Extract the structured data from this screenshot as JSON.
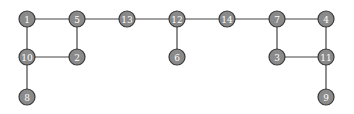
{
  "graph": {
    "node_color": "#8a8a8a",
    "node_stroke": "#3a3a3a",
    "edge_color": "#444444",
    "label_color": "#ffffff",
    "nodes": [
      {
        "id": "1",
        "x": 27,
        "y": 19
      },
      {
        "id": "5",
        "x": 77,
        "y": 19
      },
      {
        "id": "13",
        "x": 127,
        "y": 19
      },
      {
        "id": "12",
        "x": 177,
        "y": 19
      },
      {
        "id": "14",
        "x": 227,
        "y": 19
      },
      {
        "id": "7",
        "x": 277,
        "y": 19
      },
      {
        "id": "4",
        "x": 326,
        "y": 19
      },
      {
        "id": "10",
        "x": 27,
        "y": 57
      },
      {
        "id": "2",
        "x": 77,
        "y": 57
      },
      {
        "id": "6",
        "x": 177,
        "y": 57
      },
      {
        "id": "3",
        "x": 277,
        "y": 57
      },
      {
        "id": "11",
        "x": 326,
        "y": 57
      },
      {
        "id": "8",
        "x": 27,
        "y": 97
      },
      {
        "id": "9",
        "x": 326,
        "y": 97
      }
    ],
    "edges": [
      [
        "1",
        "5"
      ],
      [
        "5",
        "13"
      ],
      [
        "13",
        "12"
      ],
      [
        "12",
        "14"
      ],
      [
        "14",
        "7"
      ],
      [
        "7",
        "4"
      ],
      [
        "1",
        "10"
      ],
      [
        "5",
        "2"
      ],
      [
        "10",
        "2"
      ],
      [
        "10",
        "8"
      ],
      [
        "12",
        "6"
      ],
      [
        "7",
        "3"
      ],
      [
        "4",
        "11"
      ],
      [
        "3",
        "11"
      ],
      [
        "11",
        "9"
      ]
    ]
  }
}
